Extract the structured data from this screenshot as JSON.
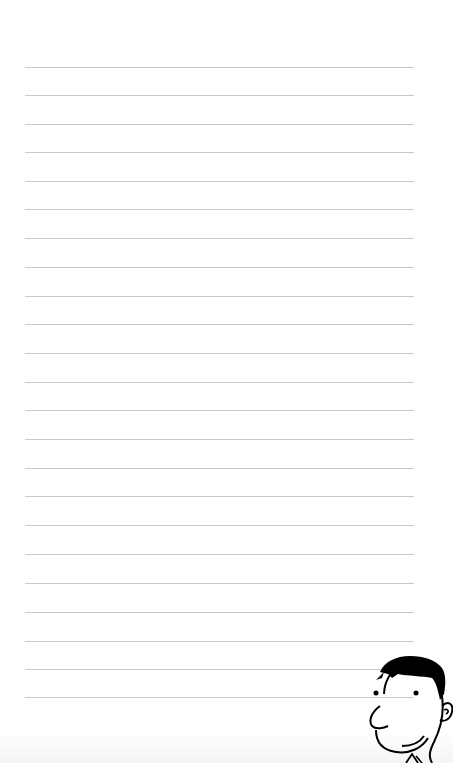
{
  "page": {
    "type": "lined-notebook-page",
    "header_faint_text": "",
    "background_color": "#ffffff",
    "line_color": "#c9c9c9",
    "line_count": 23,
    "line_positions_y": [
      67,
      95,
      124,
      152,
      181,
      209,
      238,
      267,
      296,
      324,
      353,
      382,
      410,
      439,
      468,
      496,
      525,
      554,
      583,
      612,
      641,
      669,
      697
    ],
    "line_left_x": 25,
    "line_right_x": 414
  },
  "illustration": {
    "name": "cartoon-man-face",
    "description": "Cartoon man with black hair peeking from bottom-right corner",
    "stroke_color": "#000000"
  }
}
